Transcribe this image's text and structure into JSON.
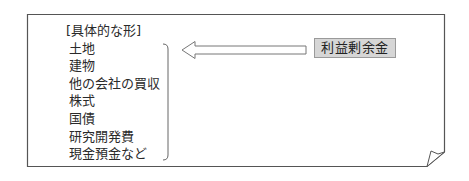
{
  "diagram": {
    "list": {
      "heading": "[具体的な形]",
      "items": [
        "土地",
        "建物",
        "他の会社の買収",
        "株式",
        "国債",
        "研究開発費",
        "現金預金など"
      ]
    },
    "source_box": {
      "label": "利益剰余金",
      "fill_color": "#d6d6d6",
      "border_color": "#9a9a9a"
    },
    "arrow": {
      "direction": "left",
      "style": "hollow",
      "from": "利益剰余金",
      "to": "[具体的な形]"
    },
    "frame": {
      "style": "page-curl",
      "stroke_color": "#555555"
    }
  }
}
